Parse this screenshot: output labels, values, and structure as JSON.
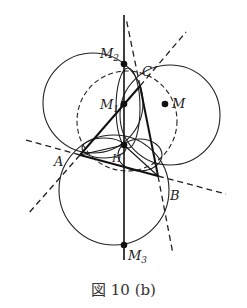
{
  "figure": {
    "caption": "図 10 (b)",
    "points": {
      "A": "A",
      "B": "B",
      "C": "C",
      "H": "H",
      "M": "M",
      "M1": "M",
      "M1_sub": "1",
      "M2": "M",
      "M2_sub": "2",
      "M3": "M",
      "M3_sub": "3"
    }
  }
}
